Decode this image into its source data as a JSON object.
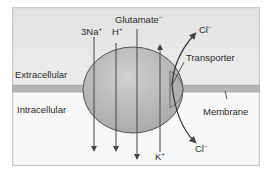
{
  "diagram": {
    "type": "membrane transporter schematic",
    "regions": {
      "extracellular": "Extracellular",
      "intracellular": "Intracellular"
    },
    "structures": {
      "transporter": "Transporter",
      "membrane": "Membrane"
    },
    "ions": {
      "sodium": {
        "base": "3Na",
        "charge": "+",
        "direction": "inward"
      },
      "proton": {
        "base": "H",
        "charge": "+",
        "direction": "inward"
      },
      "glutamate": {
        "base": "Glutamate",
        "charge": "−",
        "direction": "inward"
      },
      "potassium": {
        "base": "K",
        "charge": "+",
        "direction": "outward"
      },
      "chloride_out": {
        "base": "Cl",
        "charge": "−"
      },
      "chloride_in": {
        "base": "Cl",
        "charge": "−"
      }
    },
    "colors": {
      "extracellular_bg": "#e6e6e6",
      "intracellular_bg": "#f6f6f6",
      "membrane": "#b4b4b4",
      "transporter_fill": "#b9b9b9",
      "stroke": "#444444",
      "frame_border": "#c8c8c8"
    }
  }
}
